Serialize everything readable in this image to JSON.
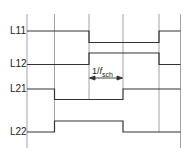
{
  "diagram": {
    "type": "timing-diagram",
    "signals": [
      {
        "label": "L11",
        "y": 31
      },
      {
        "label": "L12",
        "y": 64
      },
      {
        "label": "L21",
        "y": 89
      },
      {
        "label": "L22",
        "y": 132
      }
    ],
    "annotation": {
      "prefix": "1/",
      "symbol": "f",
      "subscript": "sch"
    },
    "colors": {
      "line": "#333333",
      "grid": "#888888",
      "background": "#ffffff"
    }
  }
}
